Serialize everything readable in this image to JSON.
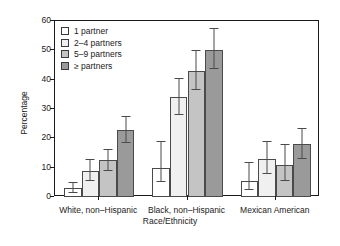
{
  "chart_data": {
    "type": "bar",
    "title": "",
    "xlabel": "Race/Ethnicity",
    "ylabel": "Percentage",
    "ylim": [
      0,
      60
    ],
    "yticks": [
      0,
      10,
      20,
      30,
      40,
      50,
      60
    ],
    "ytick_labels": [
      "0",
      "10",
      "20",
      "30",
      "40",
      "50",
      "60"
    ],
    "grid": false,
    "legend_position": "upper-left-inside",
    "categories": [
      "White, non–Hispanic",
      "Black, non–Hispanic",
      "Mexican American"
    ],
    "series": [
      {
        "name": "1 partner",
        "color": "#ffffff",
        "values": [
          3.0,
          10.0,
          5.5
        ],
        "err_low": [
          1.5,
          5.0,
          2.5
        ],
        "err_high": [
          5.0,
          19.0,
          12.0
        ]
      },
      {
        "name": "2–4 partners",
        "color": "#f0f0f0",
        "values": [
          9.0,
          34.0,
          13.0
        ],
        "err_low": [
          5.5,
          28.0,
          8.0
        ],
        "err_high": [
          13.0,
          40.5,
          19.0
        ]
      },
      {
        "name": "5–9 partners",
        "color": "#c4c4c4",
        "values": [
          12.5,
          43.0,
          11.0
        ],
        "err_low": [
          9.0,
          36.5,
          5.5
        ],
        "err_high": [
          16.5,
          50.0,
          18.0
        ]
      },
      {
        "name": "≥ partners",
        "color": "#9a9a9a",
        "values": [
          23.0,
          50.0,
          18.0
        ],
        "err_low": [
          18.5,
          43.5,
          13.0
        ],
        "err_high": [
          27.5,
          57.5,
          23.5
        ]
      }
    ],
    "annotations": [
      {
        "text": "§",
        "category": "White, non–Hispanic",
        "series": "1 partner"
      }
    ]
  },
  "legend": {
    "items": [
      {
        "label": "1 partner",
        "swatch": "legend-swatch-1-partner"
      },
      {
        "label": "2–4 partners",
        "swatch": "legend-swatch-2-4-partners"
      },
      {
        "label": "5–9 partners",
        "swatch": "legend-swatch-5-9-partners"
      },
      {
        "label": "≥ partners",
        "swatch": "legend-swatch-10-plus-partners"
      }
    ]
  },
  "axes": {
    "y_title": "Percentage",
    "x_title": "Race/Ethnicity"
  }
}
